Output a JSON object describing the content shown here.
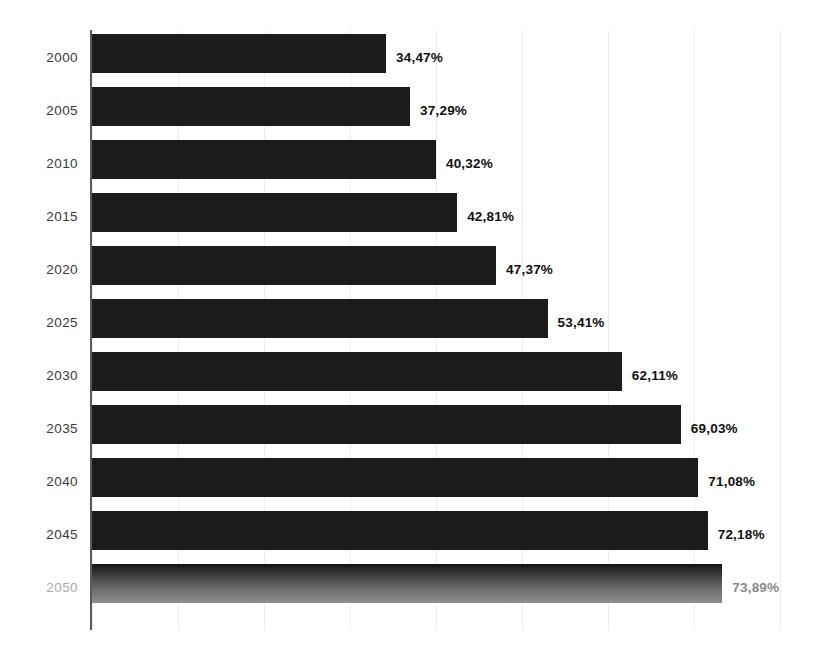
{
  "chart_data": {
    "type": "bar",
    "orientation": "horizontal",
    "title": "",
    "subtitle": "",
    "xlabel": "",
    "ylabel": "",
    "categories": [
      "2000",
      "2005",
      "2010",
      "2015",
      "2020",
      "2025",
      "2030",
      "2035",
      "2040",
      "2045",
      "2050"
    ],
    "values": [
      34.47,
      37.29,
      40.32,
      42.81,
      47.37,
      53.41,
      62.11,
      69.03,
      71.08,
      72.18,
      73.89
    ],
    "value_labels": [
      "34,47%",
      "37,29%",
      "40,32%",
      "42,81%",
      "47,37%",
      "53,41%",
      "62,11%",
      "69,03%",
      "71,08%",
      "72,18%",
      "73,89%"
    ],
    "units": "%",
    "decimal_separator": ",",
    "xlim": [
      0,
      85
    ],
    "ylim": null,
    "grid": {
      "vertical": true,
      "horizontal": false,
      "color": "#ededed",
      "count": 8
    },
    "legend": {
      "present": false,
      "position": "none",
      "entries": []
    },
    "axis": {
      "x_tick_labels": [],
      "y_tick_labels": [
        "2000",
        "2005",
        "2010",
        "2015",
        "2020",
        "2025",
        "2030",
        "2035",
        "2040",
        "2045",
        "2050"
      ],
      "spine_color": "#5a5a5a"
    },
    "series": [
      {
        "name": "",
        "values": [
          34.47,
          37.29,
          40.32,
          42.81,
          47.37,
          53.41,
          62.11,
          69.03,
          71.08,
          72.18,
          73.89
        ],
        "color": "#1c1c1c",
        "highlight_index": 10,
        "highlight_color": "#8e8e8e",
        "highlight_style": "gradient"
      }
    ],
    "background_color": "#ffffff",
    "bar_color": "#1c1c1c",
    "label_color": "#111111",
    "category_label_color": "#3a3a3a",
    "highlight_label_color": "#8a8a8a"
  },
  "rows": [
    {
      "year": "2000",
      "value": 34.47,
      "label": "34,47%",
      "highlight": false
    },
    {
      "year": "2005",
      "value": 37.29,
      "label": "37,29%",
      "highlight": false
    },
    {
      "year": "2010",
      "value": 40.32,
      "label": "40,32%",
      "highlight": false
    },
    {
      "year": "2015",
      "value": 42.81,
      "label": "42,81%",
      "highlight": false
    },
    {
      "year": "2020",
      "value": 47.37,
      "label": "47,37%",
      "highlight": false
    },
    {
      "year": "2025",
      "value": 53.41,
      "label": "53,41%",
      "highlight": false
    },
    {
      "year": "2030",
      "value": 62.11,
      "label": "62,11%",
      "highlight": false
    },
    {
      "year": "2035",
      "value": 69.03,
      "label": "69,03%",
      "highlight": false
    },
    {
      "year": "2040",
      "value": 71.08,
      "label": "71,08%",
      "highlight": false
    },
    {
      "year": "2045",
      "value": 72.18,
      "label": "72,18%",
      "highlight": false
    },
    {
      "year": "2050",
      "value": 73.89,
      "label": "73,89%",
      "highlight": true
    }
  ]
}
